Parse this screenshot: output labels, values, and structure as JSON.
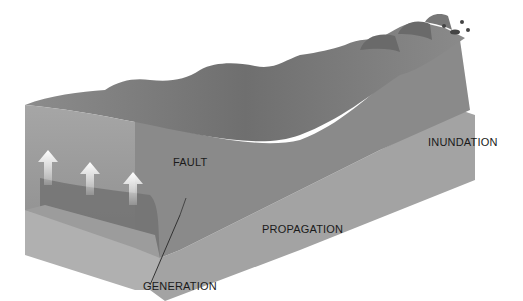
{
  "diagram": {
    "labels": {
      "fault": "FAULT",
      "generation": "GENERATION",
      "propagation": "PROPAGATION",
      "inundation": "INUNDATION"
    },
    "arrows": {
      "count": 3,
      "direction": "up",
      "color": "#f5f5f5"
    },
    "colors": {
      "background": "#ffffff",
      "water_front": "#9a9a9a",
      "water_surface": "#7e7e7e",
      "seafloor": "#a8a8a8",
      "uplift_block": "#6e6e6e",
      "shore": "#a0a0a0",
      "text": "#1a1a1a"
    }
  }
}
